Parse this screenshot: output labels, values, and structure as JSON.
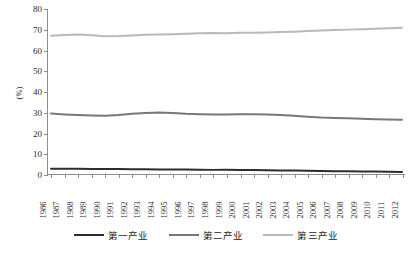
{
  "chart_data": {
    "type": "line",
    "title": "",
    "xlabel": "",
    "ylabel": "(%)",
    "ylim": [
      0,
      80
    ],
    "ytick_step": 10,
    "yticks": [
      80,
      70,
      60,
      50,
      40,
      30,
      20,
      10,
      0
    ],
    "grid": false,
    "legend_position": "bottom",
    "categories": [
      "1986",
      "1987",
      "1988",
      "1989",
      "1990",
      "1991",
      "1992",
      "1993",
      "1994",
      "1995",
      "1996",
      "1997",
      "1998",
      "1999",
      "2000",
      "2001",
      "2002",
      "2003",
      "2004",
      "2005",
      "2006",
      "2007",
      "2008",
      "2009",
      "2010",
      "2011",
      "2012"
    ],
    "series": [
      {
        "name": "第一产业",
        "color": "#2d2d2d",
        "values": [
          2.6,
          2.5,
          2.5,
          2.4,
          2.4,
          2.4,
          2.3,
          2.3,
          2.2,
          2.2,
          2.2,
          2.1,
          2.0,
          2.0,
          1.9,
          1.9,
          1.8,
          1.7,
          1.7,
          1.6,
          1.4,
          1.3,
          1.3,
          1.2,
          1.2,
          1.1,
          1.0
        ]
      },
      {
        "name": "第二产业",
        "color": "#777777",
        "values": [
          29.3,
          28.9,
          28.6,
          28.4,
          28.2,
          28.6,
          29.2,
          29.6,
          29.8,
          29.6,
          29.2,
          29.0,
          28.8,
          28.9,
          29.0,
          29.0,
          28.8,
          28.6,
          28.2,
          27.8,
          27.4,
          27.2,
          27.0,
          26.8,
          26.6,
          26.4,
          26.3
        ]
      },
      {
        "name": "第三产业",
        "color": "#b9b9b9",
        "values": [
          67.0,
          67.4,
          67.6,
          67.3,
          66.8,
          66.9,
          67.2,
          67.5,
          67.6,
          67.8,
          68.0,
          68.2,
          68.4,
          68.3,
          68.5,
          68.5,
          68.6,
          68.8,
          69.0,
          69.3,
          69.6,
          69.8,
          70.0,
          70.2,
          70.4,
          70.7,
          70.9
        ]
      }
    ]
  },
  "legend": {
    "items": [
      {
        "label": "第一产业",
        "color": "#2d2d2d"
      },
      {
        "label": "第二产业",
        "color": "#777777"
      },
      {
        "label": "第三产业",
        "color": "#b9b9b9"
      }
    ]
  },
  "axis": {
    "y_title": "(%)"
  }
}
